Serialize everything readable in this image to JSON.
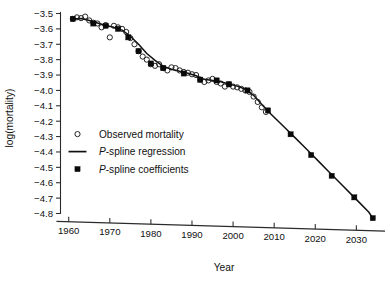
{
  "figure": {
    "name": "log-mortality-pspline-figure"
  },
  "axes": {
    "x": {
      "label": "Year",
      "ticks": [
        1960,
        1970,
        1980,
        1990,
        2000,
        2010,
        2020,
        2030
      ],
      "tick_labels": [
        "1960",
        "1970",
        "1980",
        "1990",
        "2000",
        "2010",
        "2020",
        "2030"
      ],
      "min": 1958,
      "max": 2036
    },
    "y": {
      "label": "log(mortality)",
      "ticks": [
        -3.5,
        -3.6,
        -3.7,
        -3.8,
        -3.9,
        -4.0,
        -4.1,
        -4.2,
        -4.3,
        -4.4,
        -4.5,
        -4.6,
        -4.7,
        -4.8
      ],
      "tick_labels": [
        "−3.5",
        "−3.6",
        "−3.7",
        "−3.8",
        "−3.9",
        "−4.0",
        "−4.1",
        "−4.2",
        "−4.3",
        "−4.4",
        "−4.5",
        "−4.6",
        "−4.7",
        "−4.8"
      ],
      "min": -4.85,
      "max": -3.47
    }
  },
  "legend": {
    "position": "center-left",
    "entries": [
      {
        "marker": "open-circle",
        "label": "Observed mortality",
        "italic_prefix": ""
      },
      {
        "marker": "line",
        "label": "-spline regression",
        "italic_prefix": "P"
      },
      {
        "marker": "filled-square",
        "label": "-spline coefficients",
        "italic_prefix": "P"
      }
    ]
  },
  "colors": {
    "ink": "#111111",
    "axis": "#2b2b2b",
    "background": "#ffffff"
  },
  "chart_data": {
    "type": "line",
    "title": "",
    "xlabel": "Year",
    "ylabel": "log(mortality)",
    "xlim": [
      1958,
      2036
    ],
    "ylim": [
      -4.85,
      -3.47
    ],
    "grid": false,
    "legend_position": "center-left",
    "series": [
      {
        "name": "Observed mortality",
        "type": "scatter",
        "marker": "open-circle",
        "x": [
          1961,
          1962,
          1963,
          1964,
          1965,
          1966,
          1967,
          1968,
          1969,
          1970,
          1971,
          1972,
          1973,
          1974,
          1975,
          1976,
          1977,
          1978,
          1979,
          1980,
          1981,
          1982,
          1983,
          1984,
          1985,
          1986,
          1987,
          1988,
          1989,
          1990,
          1991,
          1992,
          1993,
          1994,
          1995,
          1996,
          1997,
          1998,
          1999,
          2000,
          2001,
          2002,
          2003,
          2004,
          2005,
          2006,
          2007,
          2008
        ],
        "y": [
          -3.535,
          -3.525,
          -3.53,
          -3.52,
          -3.545,
          -3.56,
          -3.565,
          -3.59,
          -3.575,
          -3.655,
          -3.58,
          -3.59,
          -3.6,
          -3.62,
          -3.66,
          -3.7,
          -3.745,
          -3.78,
          -3.8,
          -3.83,
          -3.84,
          -3.83,
          -3.855,
          -3.87,
          -3.85,
          -3.855,
          -3.87,
          -3.88,
          -3.885,
          -3.895,
          -3.9,
          -3.93,
          -3.945,
          -3.935,
          -3.925,
          -3.945,
          -3.955,
          -3.975,
          -3.96,
          -3.975,
          -3.98,
          -3.99,
          -4.0,
          -4.01,
          -4.04,
          -4.075,
          -4.11,
          -4.14
        ]
      },
      {
        "name": "P-spline regression",
        "type": "line",
        "x": [
          1961,
          1963,
          1965,
          1967,
          1969,
          1971,
          1973,
          1975,
          1977,
          1979,
          1981,
          1983,
          1985,
          1987,
          1989,
          1991,
          1993,
          1995,
          1997,
          1999,
          2001,
          2003,
          2005,
          2007,
          2009,
          2011,
          2013,
          2015,
          2017,
          2019,
          2021,
          2023,
          2025,
          2027,
          2029,
          2031,
          2033,
          2034
        ],
        "y": [
          -3.535,
          -3.532,
          -3.545,
          -3.562,
          -3.578,
          -3.59,
          -3.608,
          -3.648,
          -3.7,
          -3.76,
          -3.805,
          -3.843,
          -3.862,
          -3.876,
          -3.888,
          -3.905,
          -3.928,
          -3.936,
          -3.944,
          -3.958,
          -3.972,
          -3.992,
          -4.032,
          -4.092,
          -4.148,
          -4.2,
          -4.252,
          -4.305,
          -4.358,
          -4.412,
          -4.466,
          -4.52,
          -4.574,
          -4.628,
          -4.682,
          -4.736,
          -4.79,
          -4.83
        ]
      },
      {
        "name": "P-spline coefficients",
        "type": "scatter",
        "marker": "filled-square",
        "x": [
          1961,
          1966,
          1969,
          1972,
          1974.5,
          1977,
          1980,
          1983,
          1988,
          1992,
          1996,
          1999,
          2003.5,
          2008.5,
          2014,
          2019,
          2024,
          2029.5,
          2034
        ],
        "y": [
          -3.535,
          -3.565,
          -3.58,
          -3.6,
          -3.655,
          -3.745,
          -3.825,
          -3.855,
          -3.89,
          -3.93,
          -3.935,
          -3.96,
          -4.0,
          -4.13,
          -4.285,
          -4.42,
          -4.555,
          -4.695,
          -4.83
        ]
      }
    ]
  }
}
